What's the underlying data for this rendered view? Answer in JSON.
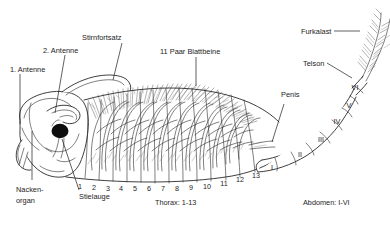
{
  "figure": {
    "background_color": "#ffffff",
    "ink_color": "#1c1c1c"
  },
  "labels": {
    "antenne1": "1. Antenne",
    "antenne2": "2. Antenne",
    "stirnfortsatz": "Stirnfortsatz",
    "blattbeine": "11 Paar Blattbeine",
    "furkalast": "Furkalast",
    "telson": "Telson",
    "penis": "Penis",
    "nackenorgan_line1": "Nacken-",
    "nackenorgan_line2": "organ",
    "stielauge": "Stielauge"
  },
  "captions": {
    "thorax": "Thorax: 1-13",
    "abdomen": "Abdomen: I-VI"
  },
  "thorax_segments": [
    "1",
    "2",
    "3",
    "4",
    "5",
    "6",
    "7",
    "8",
    "9",
    "10",
    "11",
    "12",
    "13"
  ],
  "abdomen_segments": [
    "I",
    "II",
    "III",
    "IV",
    "V",
    "VI"
  ],
  "colors": {
    "ink": "#1c1c1c",
    "eye": "#0d0d0d",
    "paper": "#ffffff",
    "seta": "#3a3a3a"
  }
}
